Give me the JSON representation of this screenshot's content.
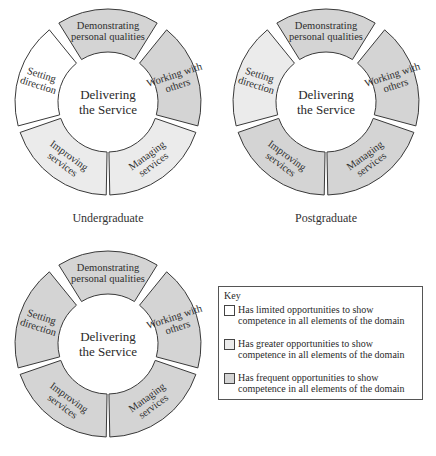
{
  "colors": {
    "limited": "#ffffff",
    "greater": "#ebebeb",
    "frequent": "#d4d4d4",
    "stroke": "#3a3a3a"
  },
  "center_label": [
    "Delivering",
    "the Service"
  ],
  "segments": [
    {
      "id": "demonstrating",
      "lines": [
        "Demonstrating",
        "personal qualities"
      ]
    },
    {
      "id": "working",
      "lines": [
        "Working with",
        "others"
      ]
    },
    {
      "id": "managing",
      "lines": [
        "Managing",
        "services"
      ]
    },
    {
      "id": "improving",
      "lines": [
        "Improving",
        "services"
      ]
    },
    {
      "id": "setting",
      "lines": [
        "Setting",
        "direction"
      ]
    }
  ],
  "wheels": [
    {
      "caption": "Undergraduate",
      "levels": {
        "demonstrating": "frequent",
        "working": "frequent",
        "managing": "greater",
        "improving": "greater",
        "setting": "limited"
      }
    },
    {
      "caption": "Postgraduate",
      "levels": {
        "demonstrating": "frequent",
        "working": "frequent",
        "managing": "frequent",
        "improving": "frequent",
        "setting": "greater"
      }
    },
    {
      "caption": "",
      "levels": {
        "demonstrating": "frequent",
        "working": "frequent",
        "managing": "frequent",
        "improving": "frequent",
        "setting": "frequent"
      }
    }
  ],
  "key": {
    "title": "Key",
    "items": [
      {
        "level": "limited",
        "text": "Has limited opportunities to show competence in all elements of the domain"
      },
      {
        "level": "greater",
        "text": "Has greater opportunities to show competence in all elements of the domain"
      },
      {
        "level": "frequent",
        "text": "Has frequent opportunities to show competence in all elements of the domain"
      }
    ]
  }
}
